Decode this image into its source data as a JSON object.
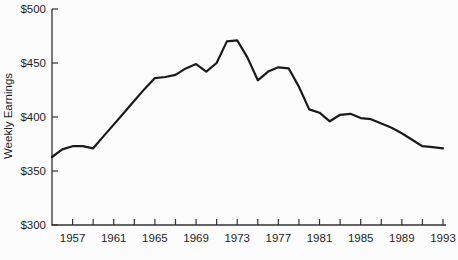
{
  "chart_data": {
    "type": "line",
    "title": "",
    "xlabel": "",
    "ylabel": "Weekly Earnings",
    "ylim": [
      300,
      500
    ],
    "xlim": [
      1955,
      1993
    ],
    "grid": false,
    "legend": null,
    "line_color": "#1a1a1a",
    "axis_color": "#333333",
    "x": [
      1955,
      1956,
      1957,
      1958,
      1959,
      1960,
      1961,
      1962,
      1963,
      1964,
      1965,
      1966,
      1967,
      1968,
      1969,
      1970,
      1971,
      1972,
      1973,
      1974,
      1975,
      1976,
      1977,
      1978,
      1979,
      1980,
      1981,
      1982,
      1983,
      1984,
      1985,
      1986,
      1987,
      1988,
      1989,
      1990,
      1991,
      1992,
      1993
    ],
    "values": [
      363,
      370,
      373,
      373,
      371,
      382,
      393,
      404,
      415,
      426,
      436,
      437,
      439,
      445,
      449,
      442,
      450,
      470,
      471,
      455,
      434,
      442,
      446,
      445,
      428,
      407,
      404,
      396,
      402,
      403,
      399,
      398,
      394,
      390,
      385,
      379,
      373,
      372,
      371
    ],
    "y_ticks": [
      300,
      350,
      400,
      450,
      500
    ],
    "y_tick_labels": [
      "$300",
      "$350",
      "$400",
      "$450",
      "$500"
    ],
    "x_minor_ticks": [
      1957,
      1959,
      1961,
      1963,
      1965,
      1967,
      1969,
      1971,
      1973,
      1975,
      1977,
      1979,
      1981,
      1983,
      1985,
      1987,
      1989,
      1991,
      1993
    ],
    "x_tick_labels": [
      "1957",
      "1961",
      "1965",
      "1969",
      "1973",
      "1977",
      "1981",
      "1985",
      "1989",
      "1993"
    ],
    "x_label_years": [
      1957,
      1961,
      1965,
      1969,
      1973,
      1977,
      1981,
      1985,
      1989,
      1993
    ]
  }
}
